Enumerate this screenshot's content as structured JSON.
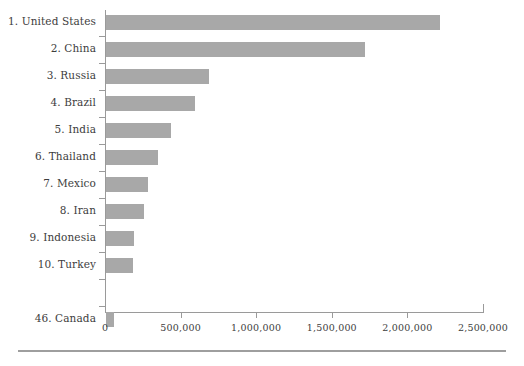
{
  "chart_data": {
    "type": "bar",
    "orientation": "horizontal",
    "title": "",
    "subtitle": "",
    "xlabel": "",
    "ylabel": "",
    "grid": false,
    "legend": null,
    "xlim": [
      0,
      2500000
    ],
    "xticks": [
      0,
      500000,
      1000000,
      1500000,
      2000000,
      2500000
    ],
    "xticklabels": [
      "0",
      "500,000",
      "1,000,000",
      "1,500,000",
      "2,000,000",
      "2,500,000"
    ],
    "categories": [
      "1. United States",
      "2. China",
      "3. Russia",
      "4. Brazil",
      "5. India",
      "6. Thailand",
      "7. Mexico",
      "8. Iran",
      "9. Indonesia",
      "10. Turkey",
      "",
      "46. Canada"
    ],
    "values": [
      2210000,
      1715000,
      680000,
      590000,
      430000,
      345000,
      275000,
      250000,
      185000,
      180000,
      null,
      50000
    ],
    "bar_color": "#a8a8a8",
    "axis_color": "#9a9a9a",
    "text_color": "#3d3d3d",
    "background_color": "#ffffff"
  }
}
